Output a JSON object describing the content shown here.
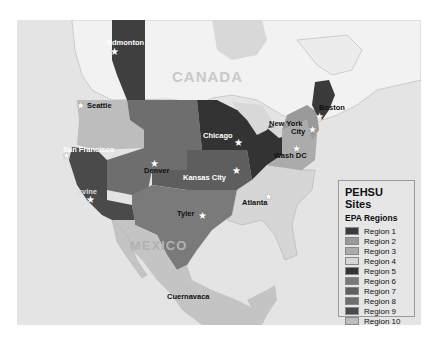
{
  "legend": {
    "title": "PEHSU Sites",
    "subtitle": "EPA Regions",
    "items": [
      {
        "label": "Region  1",
        "color": "#3a3a3a"
      },
      {
        "label": "Region  2",
        "color": "#9a9a9a"
      },
      {
        "label": "Region  3",
        "color": "#ababab"
      },
      {
        "label": "Region  4",
        "color": "#d6d6d6"
      },
      {
        "label": "Region  5",
        "color": "#333333"
      },
      {
        "label": "Region  6",
        "color": "#7a7a7a"
      },
      {
        "label": "Region  7",
        "color": "#5e5e5e"
      },
      {
        "label": "Region  8",
        "color": "#6e6e6e"
      },
      {
        "label": "Region  9",
        "color": "#4a4a4a"
      },
      {
        "label": "Region 10",
        "color": "#bdbdbd"
      }
    ]
  },
  "countries": {
    "canada": "CANADA",
    "mexico": "MEXICO"
  },
  "cities": {
    "edmonton": "Edmonton",
    "seattle": "Seattle",
    "san_francisco": "San Francisco",
    "irvine": "Irvine",
    "denver": "Denver",
    "kansas_city": "Kansas City",
    "chicago": "Chicago",
    "new_york_1": "New York",
    "new_york_2": "City",
    "boston": "Boston",
    "wash_dc": "Wash DC",
    "atlanta": "Atlanta",
    "tyler": "Tyler",
    "cuernavaca": "Cuernavaca"
  }
}
